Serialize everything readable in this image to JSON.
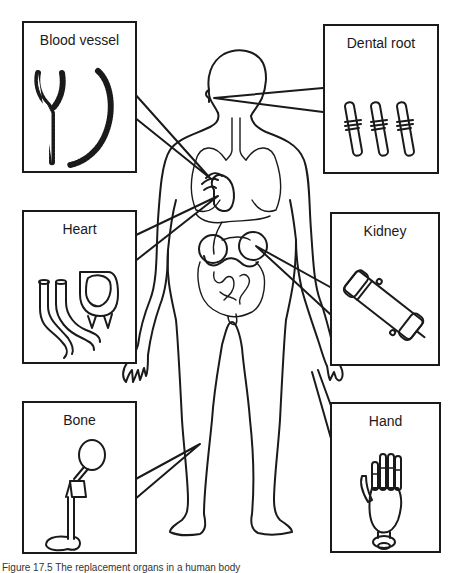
{
  "figure": {
    "caption": "Figure 17.5 The replacement organs in a human body",
    "line_color": "#1a1a1a",
    "background": "#ffffff"
  },
  "panels": [
    {
      "id": "blood-vessel",
      "label": "Blood vessel",
      "side": "left",
      "row": 0
    },
    {
      "id": "dental-root",
      "label": "Dental root",
      "side": "right",
      "row": 0
    },
    {
      "id": "heart",
      "label": "Heart",
      "side": "left",
      "row": 1
    },
    {
      "id": "kidney",
      "label": "Kidney",
      "side": "right",
      "row": 1
    },
    {
      "id": "bone",
      "label": "Bone",
      "side": "left",
      "row": 2
    },
    {
      "id": "hand",
      "label": "Hand",
      "side": "right",
      "row": 2
    }
  ]
}
